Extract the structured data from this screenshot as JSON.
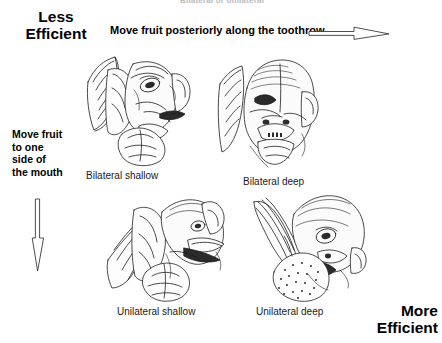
{
  "figure": {
    "top_clipped_text": "Bilateral or unilateral",
    "axis_labels": {
      "less_efficient": "Less\nEfficient",
      "less_efficient_line1": "Less",
      "less_efficient_line2": "Efficient",
      "more_efficient_line1": "More",
      "more_efficient_line2": "Efficient"
    },
    "horizontal_axis_label": "Move fruit posteriorly along the toothrow",
    "vertical_axis_label": "Move fruit to one side of the mouth",
    "vertical_axis_lines": [
      "Move fruit",
      "to one",
      "side of",
      "the mouth"
    ],
    "arrows": {
      "horizontal": "right-arrow-icon",
      "vertical": "down-arrow-icon"
    },
    "panels": [
      {
        "id": "bilateral-shallow",
        "caption": "Bilateral shallow",
        "icon": "bat-head-three-quarter-icon"
      },
      {
        "id": "bilateral-deep",
        "caption": "Bilateral deep",
        "icon": "bat-head-frontal-icon"
      },
      {
        "id": "unilateral-shallow",
        "caption": "Unilateral shallow",
        "icon": "bat-head-profile-icon"
      },
      {
        "id": "unilateral-deep",
        "caption": "Unilateral deep",
        "icon": "bat-head-fruit-icon"
      }
    ],
    "colors": {
      "background": "#ffffff",
      "ink": "#000000",
      "caption": "#1a1a1a",
      "faint": "#b9b9bd"
    }
  }
}
